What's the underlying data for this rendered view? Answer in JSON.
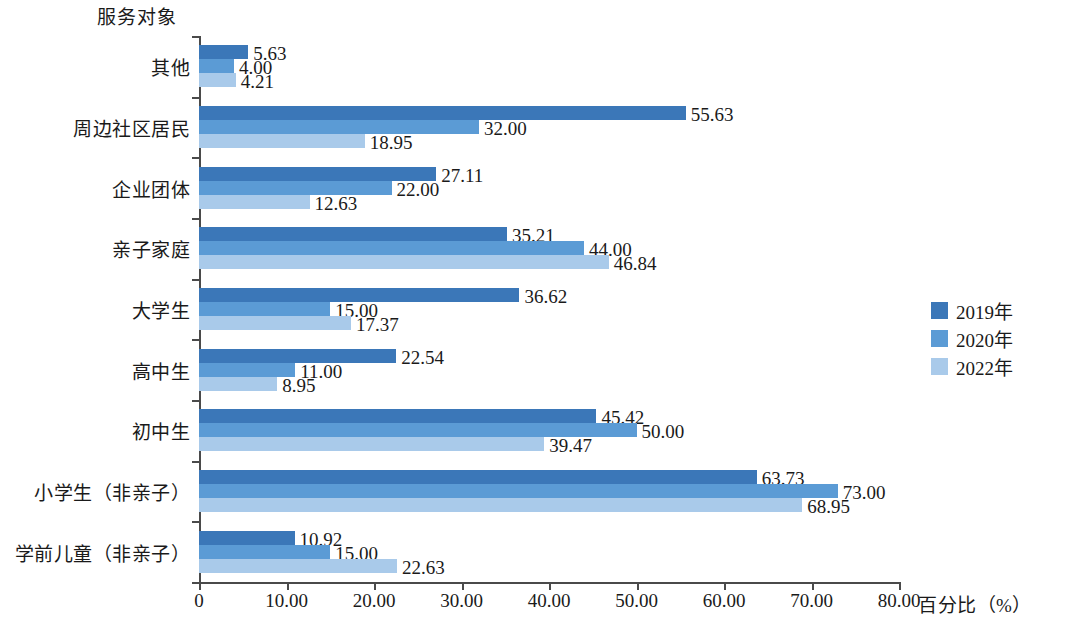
{
  "chart_data": {
    "type": "bar",
    "orientation": "horizontal",
    "title": "",
    "ylabel": "服务对象",
    "xlabel": "百分比（%）",
    "xlim": [
      0,
      80
    ],
    "xticks": [
      "0",
      "10.00",
      "20.00",
      "30.00",
      "40.00",
      "50.00",
      "60.00",
      "70.00",
      "80.00"
    ],
    "grid": false,
    "legend_position": "right",
    "categories": [
      "其他",
      "周边社区居民",
      "企业团体",
      "亲子家庭",
      "大学生",
      "高中生",
      "初中生",
      "小学生（非亲子）",
      "学前儿童（非亲子）"
    ],
    "series": [
      {
        "name": "2019年",
        "color": "#3b77b8",
        "values": [
          5.63,
          55.63,
          27.11,
          35.21,
          36.62,
          22.54,
          45.42,
          63.73,
          10.92
        ],
        "labels": [
          "5.63",
          "55.63",
          "27.11",
          "35.21",
          "36.62",
          "22.54",
          "45.42",
          "63.73",
          "10.92"
        ]
      },
      {
        "name": "2020年",
        "color": "#5b9bd5",
        "values": [
          4.0,
          32.0,
          22.0,
          44.0,
          15.0,
          11.0,
          50.0,
          73.0,
          15.0
        ],
        "labels": [
          "4.00",
          "32.00",
          "22.00",
          "44.00",
          "15.00",
          "11.00",
          "50.00",
          "73.00",
          "15.00"
        ]
      },
      {
        "name": "2022年",
        "color": "#a9caea",
        "values": [
          4.21,
          18.95,
          12.63,
          46.84,
          17.37,
          8.95,
          39.47,
          68.95,
          22.63
        ],
        "labels": [
          "4.21",
          "18.95",
          "12.63",
          "46.84",
          "17.37",
          "8.95",
          "39.47",
          "68.95",
          "22.63"
        ]
      }
    ]
  },
  "legend": {
    "items": [
      {
        "label": "2019年",
        "color": "#3b77b8"
      },
      {
        "label": "2020年",
        "color": "#5b9bd5"
      },
      {
        "label": "2022年",
        "color": "#a9caea"
      }
    ]
  }
}
